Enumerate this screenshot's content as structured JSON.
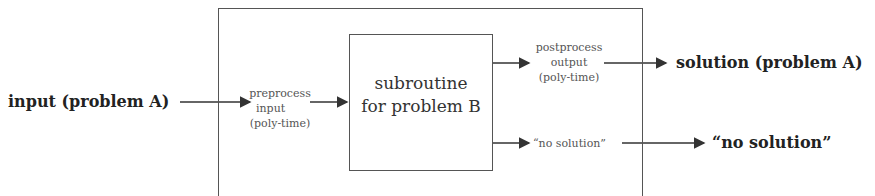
{
  "diagram": {
    "input_label": "input (problem A)",
    "preprocess": [
      "preprocess",
      "input",
      "(poly-time)"
    ],
    "subroutine": [
      "subroutine",
      "for problem B"
    ],
    "postprocess": [
      "postprocess",
      "output",
      "(poly-time)"
    ],
    "no_solution_inner": "“no solution”",
    "solution_label": "solution (problem A)",
    "no_solution_outer": "“no solution”",
    "colors": {
      "line": "#333333",
      "box": "#555555"
    }
  }
}
